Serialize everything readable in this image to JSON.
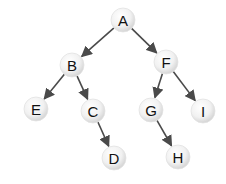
{
  "diagram": {
    "type": "binary-tree",
    "colors": {
      "background": "#ffffff",
      "node_fill_center": "#ffffff",
      "node_fill_edge": "#d6d6d6",
      "edge": "#4a4a4a",
      "label": "#111111"
    },
    "nodes": [
      {
        "id": "A",
        "label": "A",
        "x": 123,
        "y": 20
      },
      {
        "id": "B",
        "label": "B",
        "x": 72,
        "y": 65
      },
      {
        "id": "F",
        "label": "F",
        "x": 166,
        "y": 62
      },
      {
        "id": "E",
        "label": "E",
        "x": 36,
        "y": 109
      },
      {
        "id": "C",
        "label": "C",
        "x": 93,
        "y": 111
      },
      {
        "id": "G",
        "label": "G",
        "x": 151,
        "y": 110
      },
      {
        "id": "I",
        "label": "I",
        "x": 203,
        "y": 111
      },
      {
        "id": "D",
        "label": "D",
        "x": 114,
        "y": 158
      },
      {
        "id": "H",
        "label": "H",
        "x": 178,
        "y": 157
      }
    ],
    "edges": [
      {
        "from": "A",
        "to": "B"
      },
      {
        "from": "A",
        "to": "F"
      },
      {
        "from": "B",
        "to": "E"
      },
      {
        "from": "B",
        "to": "C"
      },
      {
        "from": "C",
        "to": "D"
      },
      {
        "from": "F",
        "to": "G"
      },
      {
        "from": "F",
        "to": "I"
      },
      {
        "from": "G",
        "to": "H"
      }
    ]
  }
}
